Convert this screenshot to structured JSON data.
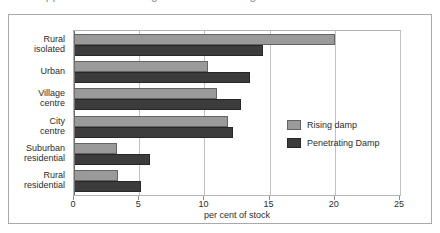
{
  "figure": {
    "title_sliver": "a cropped line of heading text above the figure"
  },
  "chart_data": {
    "type": "bar",
    "orientation": "horizontal",
    "title": "",
    "xlabel": "per cent of stock",
    "ylabel": "",
    "xlim": [
      0,
      25
    ],
    "xticks": [
      0,
      5,
      10,
      15,
      20,
      25
    ],
    "xticklabels": [
      "0",
      "5",
      "10",
      "15",
      "20",
      "25"
    ],
    "grid": true,
    "grid_axis": "x",
    "legend_position": "center-right",
    "categories": [
      "Rural isolated",
      "Urban",
      "Village centre",
      "City centre",
      "Suburban residential",
      "Rural residential"
    ],
    "category_lines": [
      [
        "Rural",
        "isolated"
      ],
      [
        "Urban"
      ],
      [
        "Village",
        "centre"
      ],
      [
        "City",
        "centre"
      ],
      [
        "Suburban",
        "residential"
      ],
      [
        "Rural",
        "residential"
      ]
    ],
    "series": [
      {
        "name": "Rising damp",
        "color": "#9a9a9a",
        "values": [
          20.0,
          10.3,
          11.0,
          11.8,
          3.3,
          3.4
        ]
      },
      {
        "name": "Penetrating Damp",
        "color": "#3c3c3c",
        "values": [
          14.5,
          13.5,
          12.8,
          12.2,
          5.8,
          5.1
        ]
      }
    ]
  }
}
